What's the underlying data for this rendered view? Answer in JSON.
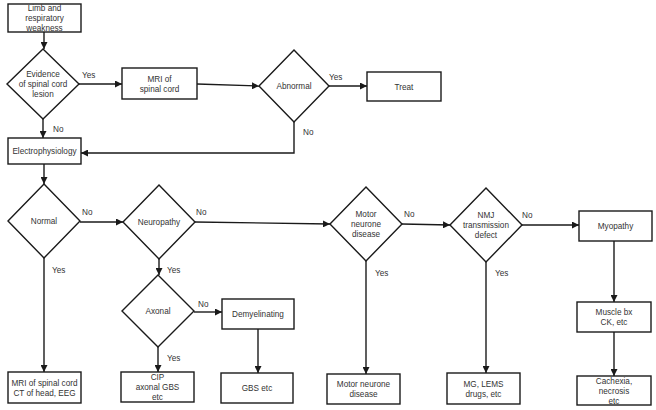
{
  "diagram": {
    "type": "flowchart",
    "nodes": [
      {
        "id": "start",
        "shape": "box",
        "lines": [
          "Limb and",
          "respiratory",
          "weakness"
        ],
        "x": 8,
        "y": 4,
        "w": 73,
        "h": 28
      },
      {
        "id": "spinal_lesion",
        "shape": "diamond",
        "lines": [
          "Evidence",
          "of spinal cord",
          "lesion"
        ],
        "cx": 43,
        "cy": 84,
        "rx": 36,
        "ry": 35
      },
      {
        "id": "mri_spinal",
        "shape": "box",
        "lines": [
          "MRI of",
          "spinal cord"
        ],
        "x": 122,
        "y": 68,
        "w": 75,
        "h": 31
      },
      {
        "id": "abnormal",
        "shape": "diamond",
        "lines": [
          "Abnormal"
        ],
        "cx": 294,
        "cy": 86,
        "rx": 35,
        "ry": 36
      },
      {
        "id": "treat",
        "shape": "box",
        "lines": [
          "Treat"
        ],
        "x": 367,
        "y": 72,
        "w": 74,
        "h": 29
      },
      {
        "id": "electro",
        "shape": "box",
        "lines": [
          "Electrophysiology"
        ],
        "x": 8,
        "y": 138,
        "w": 73,
        "h": 26
      },
      {
        "id": "normal",
        "shape": "diamond",
        "lines": [
          "Normal"
        ],
        "cx": 44,
        "cy": 221,
        "rx": 36,
        "ry": 37
      },
      {
        "id": "neuropathy",
        "shape": "diamond",
        "lines": [
          "Neuropathy"
        ],
        "cx": 159,
        "cy": 222,
        "rx": 36,
        "ry": 37
      },
      {
        "id": "axonal",
        "shape": "diamond",
        "lines": [
          "Axonal"
        ],
        "cx": 158,
        "cy": 311,
        "rx": 36,
        "ry": 36
      },
      {
        "id": "demyelinating",
        "shape": "box",
        "lines": [
          "Demyelinating"
        ],
        "x": 222,
        "y": 299,
        "w": 72,
        "h": 30
      },
      {
        "id": "mnd_q",
        "shape": "diamond",
        "lines": [
          "Motor",
          "neurone",
          "disease"
        ],
        "cx": 366,
        "cy": 224,
        "rx": 36,
        "ry": 37
      },
      {
        "id": "nmj_q",
        "shape": "diamond",
        "lines": [
          "NMJ",
          "transmission",
          "defect"
        ],
        "cx": 486,
        "cy": 225,
        "rx": 36,
        "ry": 37
      },
      {
        "id": "myopathy",
        "shape": "box",
        "lines": [
          "Myopathy"
        ],
        "x": 579,
        "y": 211,
        "w": 73,
        "h": 30
      },
      {
        "id": "muscle_bx",
        "shape": "box",
        "lines": [
          "Muscle bx",
          "CK, etc"
        ],
        "x": 577,
        "y": 302,
        "w": 74,
        "h": 30
      },
      {
        "id": "out_normal",
        "shape": "box",
        "lines": [
          "MRI of spinal cord",
          "CT of head, EEG"
        ],
        "x": 8,
        "y": 372,
        "w": 73,
        "h": 31
      },
      {
        "id": "out_axonal",
        "shape": "box",
        "lines": [
          "CIP",
          "axonal GBS",
          "etc"
        ],
        "x": 121,
        "y": 372,
        "w": 73,
        "h": 30
      },
      {
        "id": "out_demyel",
        "shape": "box",
        "lines": [
          "GBS etc"
        ],
        "x": 221,
        "y": 373,
        "w": 72,
        "h": 30
      },
      {
        "id": "out_mnd",
        "shape": "box",
        "lines": [
          "Motor neurone",
          "disease"
        ],
        "x": 327,
        "y": 374,
        "w": 73,
        "h": 30
      },
      {
        "id": "out_nmj",
        "shape": "box",
        "lines": [
          "MG, LEMS",
          "drugs, etc"
        ],
        "x": 447,
        "y": 373,
        "w": 73,
        "h": 31
      },
      {
        "id": "out_myo",
        "shape": "box",
        "lines": [
          "Cachexia,",
          "necrosis",
          "etc"
        ],
        "x": 577,
        "y": 376,
        "w": 74,
        "h": 29
      }
    ],
    "edges": [
      {
        "from": "start",
        "to": "spinal_lesion",
        "label": "",
        "points": [
          [
            44,
            32
          ],
          [
            44,
            49
          ]
        ],
        "arrow": true
      },
      {
        "from": "spinal_lesion",
        "to": "mri_spinal",
        "label": "Yes",
        "lx": 82,
        "ly": 75,
        "points": [
          [
            79,
            84
          ],
          [
            122,
            84
          ]
        ],
        "arrow": true
      },
      {
        "from": "spinal_lesion",
        "to": "electro",
        "label": "No",
        "lx": 53,
        "ly": 129,
        "points": [
          [
            43,
            119
          ],
          [
            43,
            138
          ]
        ],
        "arrow": true
      },
      {
        "from": "mri_spinal",
        "to": "abnormal",
        "label": "",
        "points": [
          [
            197,
            84
          ],
          [
            259,
            86
          ]
        ],
        "arrow": true
      },
      {
        "from": "abnormal",
        "to": "treat",
        "label": "Yes",
        "lx": 329,
        "ly": 77,
        "points": [
          [
            329,
            86
          ],
          [
            367,
            86
          ]
        ],
        "arrow": true
      },
      {
        "from": "abnormal",
        "to": "electro",
        "label": "No",
        "lx": 303,
        "ly": 132,
        "points": [
          [
            294,
            122
          ],
          [
            294,
            153
          ],
          [
            81,
            153
          ]
        ],
        "arrow": true
      },
      {
        "from": "electro",
        "to": "normal",
        "label": "",
        "points": [
          [
            44,
            164
          ],
          [
            44,
            184
          ]
        ],
        "arrow": true
      },
      {
        "from": "normal",
        "to": "neuropathy",
        "label": "No",
        "lx": 82,
        "ly": 212,
        "points": [
          [
            80,
            222
          ],
          [
            123,
            222
          ]
        ],
        "arrow": true
      },
      {
        "from": "normal",
        "to": "out_normal",
        "label": "Yes",
        "lx": 52,
        "ly": 270,
        "points": [
          [
            44,
            258
          ],
          [
            44,
            372
          ]
        ],
        "arrow": true
      },
      {
        "from": "neuropathy",
        "to": "mnd_q",
        "label": "No",
        "lx": 196,
        "ly": 212,
        "points": [
          [
            195,
            222
          ],
          [
            330,
            224
          ]
        ],
        "arrow": true
      },
      {
        "from": "neuropathy",
        "to": "axonal",
        "label": "Yes",
        "lx": 167,
        "ly": 270,
        "points": [
          [
            159,
            259
          ],
          [
            159,
            275
          ]
        ],
        "arrow": true
      },
      {
        "from": "axonal",
        "to": "demyelinating",
        "label": "No",
        "lx": 198,
        "ly": 304,
        "points": [
          [
            194,
            312
          ],
          [
            222,
            312
          ]
        ],
        "arrow": true
      },
      {
        "from": "axonal",
        "to": "out_axonal",
        "label": "Yes",
        "lx": 167,
        "ly": 358,
        "points": [
          [
            158,
            347
          ],
          [
            158,
            372
          ]
        ],
        "arrow": true
      },
      {
        "from": "demyelinating",
        "to": "out_demyel",
        "label": "",
        "points": [
          [
            258,
            329
          ],
          [
            258,
            373
          ]
        ],
        "arrow": true
      },
      {
        "from": "mnd_q",
        "to": "nmj_q",
        "label": "No",
        "lx": 404,
        "ly": 214,
        "points": [
          [
            402,
            224
          ],
          [
            450,
            225
          ]
        ],
        "arrow": true
      },
      {
        "from": "mnd_q",
        "to": "out_mnd",
        "label": "Yes",
        "lx": 375,
        "ly": 273,
        "points": [
          [
            366,
            261
          ],
          [
            366,
            374
          ]
        ],
        "arrow": true
      },
      {
        "from": "nmj_q",
        "to": "myopathy",
        "label": "No",
        "lx": 522,
        "ly": 215,
        "points": [
          [
            522,
            225
          ],
          [
            579,
            225
          ]
        ],
        "arrow": true
      },
      {
        "from": "nmj_q",
        "to": "out_nmj",
        "label": "Yes",
        "lx": 495,
        "ly": 273,
        "points": [
          [
            486,
            262
          ],
          [
            486,
            373
          ]
        ],
        "arrow": true
      },
      {
        "from": "myopathy",
        "to": "muscle_bx",
        "label": "",
        "points": [
          [
            614,
            241
          ],
          [
            614,
            302
          ]
        ],
        "arrow": true
      },
      {
        "from": "muscle_bx",
        "to": "out_myo",
        "label": "",
        "points": [
          [
            614,
            332
          ],
          [
            614,
            376
          ]
        ],
        "arrow": true
      }
    ]
  },
  "style": {
    "stroke": "#1a1a1a",
    "text": "#333333",
    "background": "#ffffff"
  }
}
